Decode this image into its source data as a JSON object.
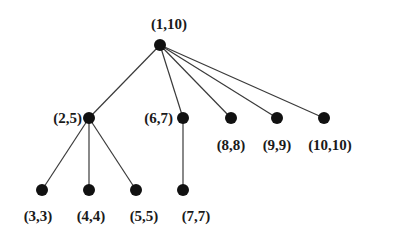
{
  "diagram": {
    "type": "tree",
    "colors": {
      "node": "#111111",
      "edge": "#3a3a3a",
      "label": "#1a1a1a",
      "background": "#ffffff"
    },
    "nodes": [
      {
        "id": "n1",
        "label": "(1,10)",
        "x": 160,
        "y": 45,
        "lx": 169,
        "ly": 29,
        "anchor": "middle"
      },
      {
        "id": "n2",
        "label": "(2,5)",
        "x": 89,
        "y": 118,
        "lx": 82,
        "ly": 123,
        "anchor": "end"
      },
      {
        "id": "n6",
        "label": "(6,7)",
        "x": 183,
        "y": 118,
        "lx": 173,
        "ly": 123,
        "anchor": "end"
      },
      {
        "id": "n8",
        "label": "(8,8)",
        "x": 231,
        "y": 118,
        "lx": 231,
        "ly": 150,
        "anchor": "middle"
      },
      {
        "id": "n9",
        "label": "(9,9)",
        "x": 277,
        "y": 118,
        "lx": 277,
        "ly": 150,
        "anchor": "middle"
      },
      {
        "id": "n10",
        "label": "(10,10)",
        "x": 324,
        "y": 118,
        "lx": 330,
        "ly": 150,
        "anchor": "middle"
      },
      {
        "id": "n3",
        "label": "(3,3)",
        "x": 42,
        "y": 190,
        "lx": 38,
        "ly": 221,
        "anchor": "middle"
      },
      {
        "id": "n4",
        "label": "(4,4)",
        "x": 89,
        "y": 190,
        "lx": 91,
        "ly": 221,
        "anchor": "middle"
      },
      {
        "id": "n5",
        "label": "(5,5)",
        "x": 136,
        "y": 190,
        "lx": 144,
        "ly": 221,
        "anchor": "middle"
      },
      {
        "id": "n7",
        "label": "(7,7)",
        "x": 183,
        "y": 190,
        "lx": 196,
        "ly": 221,
        "anchor": "middle"
      }
    ],
    "edges": [
      [
        "n1",
        "n2"
      ],
      [
        "n1",
        "n6"
      ],
      [
        "n1",
        "n8"
      ],
      [
        "n1",
        "n9"
      ],
      [
        "n1",
        "n10"
      ],
      [
        "n2",
        "n3"
      ],
      [
        "n2",
        "n4"
      ],
      [
        "n2",
        "n5"
      ],
      [
        "n6",
        "n7"
      ]
    ]
  }
}
